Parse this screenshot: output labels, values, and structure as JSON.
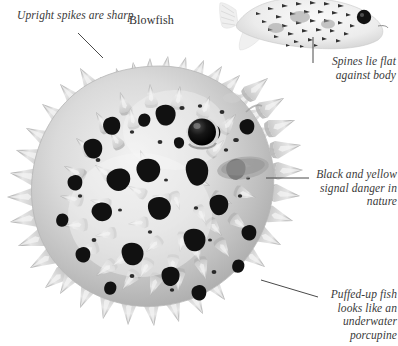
{
  "figure": {
    "title": "Blowfish",
    "background_color": "#ffffff",
    "ink_color": "#3a3a3a",
    "leader_line_color": "#4a4a4a"
  },
  "captions": {
    "upright_spikes": "Upright spikes are sharp",
    "blowfish_label": "Blowfish",
    "spines_flat": "Spines lie flat against body",
    "black_and_yellow": "Black and yellow signal danger in nature",
    "puffed_up": "Puffed-up fish looks like an underwater porcupine"
  },
  "illustrations": {
    "main_fish": {
      "name": "inflated-blowfish",
      "description": "Large puffed-up blowfish covered in outward-radiating spines with dark blotches"
    },
    "small_fish": {
      "name": "deflated-blowfish",
      "description": "Small deflated blowfish with spines lying flat against body"
    }
  }
}
